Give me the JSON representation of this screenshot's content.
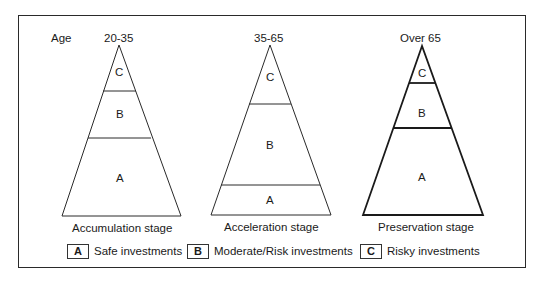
{
  "age_label": "Age",
  "pyramids": [
    {
      "age_range": "20-35",
      "stage": "Accumulation stage",
      "segments": {
        "top": "C",
        "middle": "B",
        "bottom": "A"
      }
    },
    {
      "age_range": "35-65",
      "stage": "Acceleration stage",
      "segments": {
        "top": "C",
        "middle": "B",
        "bottom": "A"
      }
    },
    {
      "age_range": "Over 65",
      "stage": "Preservation stage",
      "segments": {
        "top": "C",
        "middle": "B",
        "bottom": "A"
      }
    }
  ],
  "legend": [
    {
      "key": "A",
      "label": "Safe investments"
    },
    {
      "key": "B",
      "label": "Moderate/Risk investments"
    },
    {
      "key": "C",
      "label": "Risky investments"
    }
  ],
  "colors": {
    "line": "#2a2a2a",
    "background": "#ffffff",
    "text": "#1a1a1a"
  }
}
